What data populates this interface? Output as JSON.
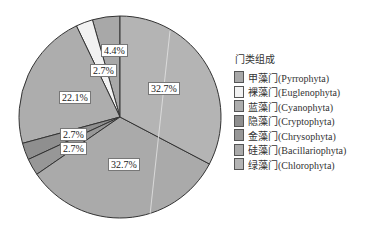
{
  "chart_data": {
    "type": "pie",
    "title": "",
    "legend_title": "门类组成",
    "legend_position": "right",
    "start_angle_deg": 0,
    "direction": "counterclockwise",
    "slices": [
      {
        "label": "甲藻门(Pyrrophyta)",
        "value": 4.4,
        "color": "#a8a8a8"
      },
      {
        "label": "裸藻门(Euglenophyta)",
        "value": 2.7,
        "color": "#f2f2f2"
      },
      {
        "label": "蓝藻门(Cyanophyta)",
        "value": 22.1,
        "color": "#adadad"
      },
      {
        "label": "隐藻门(Cryptophyta)",
        "value": 2.7,
        "color": "#8f8f8f"
      },
      {
        "label": "金藻门(Chrysophyta)",
        "value": 2.7,
        "color": "#979797"
      },
      {
        "label": "硅藻门(Bacillariophyta)",
        "value": 32.7,
        "color": "#aaaaaa"
      },
      {
        "label": "绿藻门(Chlorophyta)",
        "value": 32.7,
        "color": "#b4b4b4"
      }
    ],
    "data_labels": [
      "4.4%",
      "2.7%",
      "22.1%",
      "2.7%",
      "2.7%",
      "32.7%",
      "32.7%"
    ]
  },
  "labels": {
    "l0": "4.4%",
    "l1": "2.7%",
    "l2": "22.1%",
    "l3": "2.7%",
    "l4": "2.7%",
    "l5": "32.7%",
    "l6": "32.7%"
  },
  "legend": {
    "title": "门类组成",
    "items": [
      {
        "label": "甲藻门(Pyrrophyta)",
        "color": "#a8a8a8"
      },
      {
        "label": "裸藻门(Euglenophyta)",
        "color": "#f2f2f2"
      },
      {
        "label": "蓝藻门(Cyanophyta)",
        "color": "#adadad"
      },
      {
        "label": "隐藻门(Cryptophyta)",
        "color": "#8f8f8f"
      },
      {
        "label": "金藻门(Chrysophyta)",
        "color": "#979797"
      },
      {
        "label": "硅藻门(Bacillariophyta)",
        "color": "#aaaaaa"
      },
      {
        "label": "绿藻门(Chlorophyta)",
        "color": "#b4b4b4"
      }
    ]
  }
}
